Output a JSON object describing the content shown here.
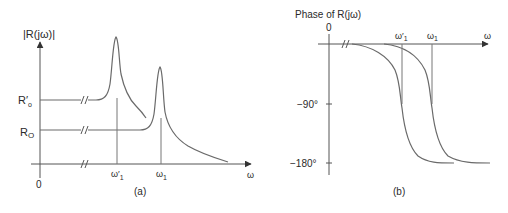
{
  "panel_a": {
    "y_axis_label": "|R(jω)|",
    "x_axis_label": "ω",
    "origin_label": "0",
    "level_labels": {
      "r_prime_o": "R′",
      "r_prime_o_sub": "o",
      "r_o": "R",
      "r_o_sub": "O"
    },
    "freq_labels": {
      "omega_prime_1": "ω′",
      "omega_prime_1_sub": "1",
      "omega_1": "ω",
      "omega_1_sub": "1"
    },
    "caption": "(a)"
  },
  "panel_b": {
    "title": "Phase of R(jω)",
    "zero_label": "0",
    "x_axis_label": "ω",
    "tick_labels": {
      "minus_90": "−90°",
      "minus_180": "−180°"
    },
    "freq_labels": {
      "omega_prime_1": "ω′",
      "omega_prime_1_sub": "1",
      "omega_1": "ω",
      "omega_1_sub": "1"
    },
    "caption": "(b)"
  },
  "colors": {
    "curve": "#6a6a6a",
    "axis": "#555555",
    "text": "#2a2a2a",
    "background": "#ffffff"
  }
}
